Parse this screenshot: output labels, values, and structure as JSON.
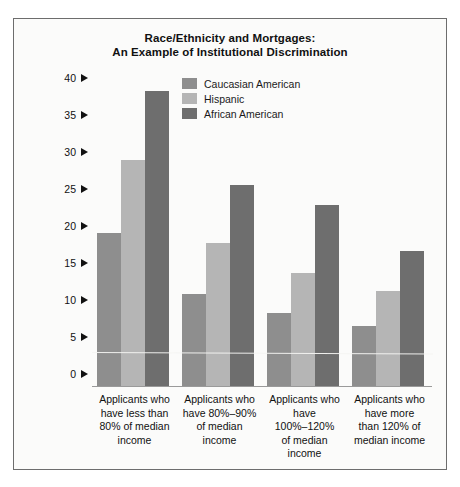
{
  "chart_data": {
    "type": "bar",
    "title": "Race/Ethnicity and Mortgages: An Example of Institutional Discrimination",
    "title_lines": [
      "Race/Ethnicity and Mortgages:",
      "An Example of Institutional Discrimination"
    ],
    "xlabel": "",
    "ylabel": "Percent of applicants who are denied mortgages",
    "ylim": [
      0,
      42
    ],
    "yticks": [
      0,
      5,
      10,
      15,
      20,
      25,
      30,
      35,
      40
    ],
    "ytick_labels": [
      "0",
      "5",
      "10",
      "15",
      "20",
      "25",
      "30",
      "35",
      "40"
    ],
    "grid": false,
    "legend_position": "top-center-inside",
    "categories": [
      "Applicants who have less than 80% of median income",
      "Applicants who have 80%–90% of median income",
      "Applicants who have 100%–120% of median income",
      "Applicants who have more than 120% of median income"
    ],
    "category_lines": [
      [
        "Applicants who",
        "have less than",
        "80% of median",
        "income"
      ],
      [
        "Applicants who",
        "have 80%–90%",
        "of median",
        "income"
      ],
      [
        "Applicants who",
        "have",
        "100%–120%",
        "of median",
        "income"
      ],
      [
        "Applicants who",
        "have more",
        "than 120% of",
        "median income"
      ]
    ],
    "series": [
      {
        "name": "Caucasian American",
        "color": "#8e8e8e",
        "values": [
          20.7,
          12.4,
          9.9,
          8.1
        ]
      },
      {
        "name": "Hispanic",
        "color": "#b5b5b5",
        "values": [
          30.5,
          19.3,
          15.3,
          12.8
        ]
      },
      {
        "name": "African American",
        "color": "#6e6e6e",
        "values": [
          39.8,
          27.2,
          24.5,
          18.2
        ]
      }
    ]
  },
  "figure": {
    "border_color": "#6d6d6d",
    "background": "#fbfbfa",
    "tick_arrow_glyph": "right-triangle"
  }
}
